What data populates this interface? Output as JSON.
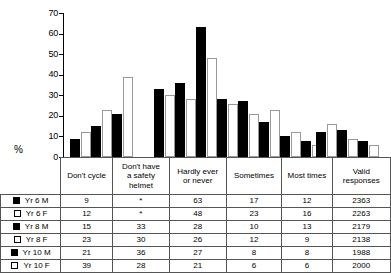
{
  "chart_data": {
    "type": "bar",
    "title": "",
    "xlabel": "",
    "ylabel": "%",
    "ylim": [
      0,
      70
    ],
    "yticks": [
      0,
      10,
      20,
      30,
      40,
      50,
      60,
      70
    ],
    "grid": false,
    "legend_position": "table-left-column",
    "categories": [
      "Don't cycle",
      "Don't have a safety helmet",
      "Hardly ever or never",
      "Sometimes",
      "Most times"
    ],
    "series": [
      {
        "name": "Yr 6 M",
        "fill": "black",
        "values": [
          9,
          null,
          63,
          17,
          12
        ]
      },
      {
        "name": "Yr 6 F",
        "fill": "white",
        "values": [
          12,
          null,
          48,
          23,
          16
        ]
      },
      {
        "name": "Yr 8 M",
        "fill": "black",
        "values": [
          15,
          33,
          28,
          10,
          13
        ]
      },
      {
        "name": "Yr 8 F",
        "fill": "white",
        "values": [
          23,
          30,
          26,
          12,
          9
        ]
      },
      {
        "name": "Yr 10 M",
        "fill": "black",
        "values": [
          21,
          36,
          27,
          8,
          8
        ]
      },
      {
        "name": "Yr 10 F",
        "fill": "white",
        "values": [
          39,
          28,
          21,
          6,
          6
        ]
      }
    ],
    "missing_marker": "*",
    "extra_column": {
      "header": "Valid responses",
      "values": [
        2363,
        2263,
        2179,
        2138,
        1988,
        2000
      ]
    }
  },
  "axis": {
    "y_label": "%",
    "ticks": [
      "70",
      "60",
      "50",
      "40",
      "30",
      "20",
      "10",
      "0"
    ]
  },
  "table": {
    "headers": [
      "",
      "Don't cycle",
      "Don't have a safety helmet",
      "Hardly ever or never",
      "Sometimes",
      "Most times",
      "Valid responses"
    ],
    "header_lines": {
      "c1": [
        "Don't cycle"
      ],
      "c2": [
        "Don't have",
        "a safety",
        "helmet"
      ],
      "c3": [
        "Hardly ever",
        "or never"
      ],
      "c4": [
        "Sometimes"
      ],
      "c5": [
        "Most times"
      ],
      "c6": [
        "Valid",
        "responses"
      ]
    },
    "rows": [
      {
        "label": "Yr 6 M",
        "swatch": "black",
        "cells": [
          "9",
          "*",
          "63",
          "17",
          "12",
          "2363"
        ]
      },
      {
        "label": "Yr 6 F",
        "swatch": "white",
        "cells": [
          "12",
          "*",
          "48",
          "23",
          "16",
          "2263"
        ]
      },
      {
        "label": "Yr 8 M",
        "swatch": "black",
        "cells": [
          "15",
          "33",
          "28",
          "10",
          "13",
          "2179"
        ]
      },
      {
        "label": "Yr 8 F",
        "swatch": "white",
        "cells": [
          "23",
          "30",
          "26",
          "12",
          "9",
          "2138"
        ]
      },
      {
        "label": "Yr 10 M",
        "swatch": "black",
        "cells": [
          "21",
          "36",
          "27",
          "8",
          "8",
          "1988"
        ]
      },
      {
        "label": "Yr 10 F",
        "swatch": "white",
        "cells": [
          "39",
          "28",
          "21",
          "6",
          "6",
          "2000"
        ]
      }
    ]
  },
  "colors": {
    "male_fill": "#000000",
    "female_fill": "#ffffff",
    "outline": "#000000",
    "grid_line": "#555555"
  }
}
